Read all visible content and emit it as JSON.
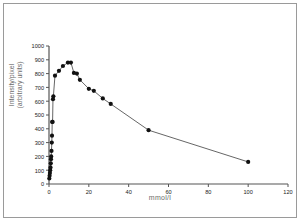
{
  "chart_data": {
    "type": "line",
    "title": "",
    "subtitle": "",
    "xlabel": "mmol/l",
    "ylabel_line1": "Intensity/pixel",
    "ylabel_line2": "(arbitrary units)",
    "xlim": [
      0,
      120
    ],
    "ylim": [
      0,
      1000
    ],
    "xticks": [
      0,
      20,
      40,
      60,
      80,
      100,
      120
    ],
    "yticks": [
      0,
      100,
      200,
      300,
      400,
      500,
      600,
      700,
      800,
      900,
      1000
    ],
    "grid": false,
    "legend": false,
    "marker": "filled-circle",
    "marker_color": "#111111",
    "line_color": "#555555",
    "series": [
      {
        "name": "Intensity/pixel",
        "x": [
          0.15,
          0.3,
          0.45,
          0.6,
          0.75,
          0.9,
          1.0,
          1.1,
          1.25,
          1.4,
          1.5,
          1.6,
          1.8,
          2.0,
          2.2,
          3.0,
          5.0,
          7.0,
          9.5,
          11.0,
          12.5,
          14.0,
          15.5,
          20.0,
          22.5,
          27.0,
          31.0,
          50.0,
          100.0
        ],
        "y": [
          40,
          60,
          80,
          100,
          120,
          150,
          180,
          200,
          240,
          300,
          350,
          450,
          450,
          615,
          635,
          785,
          820,
          855,
          880,
          880,
          805,
          800,
          755,
          690,
          675,
          620,
          580,
          390,
          160
        ]
      }
    ]
  }
}
